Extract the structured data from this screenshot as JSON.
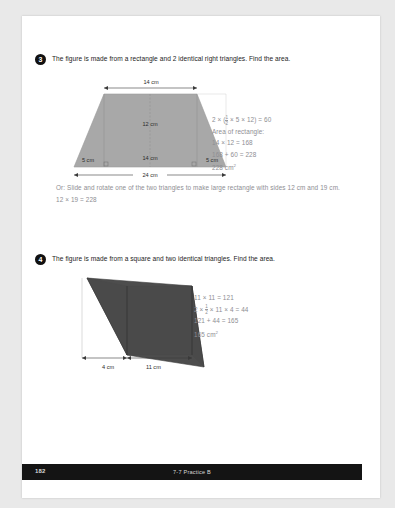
{
  "page": {
    "background_color": "#e9e9e9",
    "sheet_color": "#ffffff"
  },
  "problems": [
    {
      "number": "3",
      "prompt": "The figure is made from a rectangle and 2 identical right triangles. Find the area.",
      "figure": {
        "shape": "trapezoid",
        "fill_color": "#a8a8a8",
        "labels": {
          "top": "14 cm",
          "height": "12 cm",
          "inner_bottom": "14 cm",
          "left_leg": "5 cm",
          "right_leg": "5 cm",
          "bottom": "24 cm"
        }
      },
      "work_lines": [
        "2 × (½ × 5 × 12) = 60",
        "Area of rectangle:",
        "14 × 12 = 168",
        "168 + 60 = 228",
        "228 cm²"
      ],
      "alt_note": "Or: Slide and rotate one of the two triangles to make large rectangle with sides 12 cm and 19 cm. 12 × 19 = 228"
    },
    {
      "number": "4",
      "prompt": "The figure is made from a square and two identical triangles. Find the area.",
      "figure": {
        "shape": "square-with-two-triangles",
        "fill_color": "#4a4a4a",
        "labels": {
          "left_base": "4 cm",
          "bottom": "11 cm"
        }
      },
      "work_lines": [
        "11 × 11 = 121",
        "2 × ½ × 11 × 4 = 44",
        "121 + 44 = 165",
        "165 cm²"
      ]
    }
  ],
  "footer": {
    "page_number": "182",
    "center_label": "7-7 Practice B",
    "bar_color": "#141414"
  }
}
